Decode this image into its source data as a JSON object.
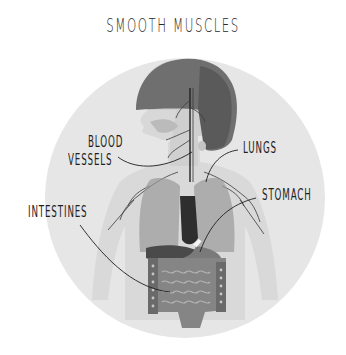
{
  "title": "SMOOTH MUSCLES",
  "diagram": {
    "type": "labeled-anatomy-illustration",
    "background_circle_color": "#e6e6e6",
    "labels": [
      {
        "id": "blood-vessels",
        "line1": "BLOOD",
        "line2": "VESSELS"
      },
      {
        "id": "lungs",
        "text": "LUNGS"
      },
      {
        "id": "stomach",
        "text": "STOMACH"
      },
      {
        "id": "intestines",
        "text": "INTESTINES"
      }
    ]
  },
  "colors": {
    "hair": "#6f6f6f",
    "skin": "#d9d9d9",
    "organs_dark": "#3a3a3a",
    "lungs": "#9a9a9a",
    "intestines": "#858585",
    "leader_line": "#1e1e1e",
    "text": "#1e1e1e"
  }
}
